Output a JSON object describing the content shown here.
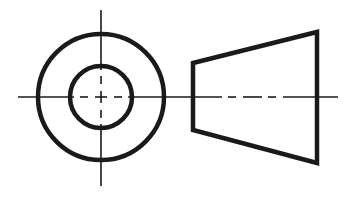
{
  "diagram": {
    "type": "orthographic-projection",
    "colors": {
      "line": "#1a1a1a",
      "background": "#ffffff"
    },
    "views": [
      {
        "name": "end-view",
        "shapes": [
          {
            "kind": "circle",
            "role": "outer-edge",
            "cx": 101,
            "cy": 97,
            "r": 63
          },
          {
            "kind": "circle",
            "role": "inner-hole",
            "cx": 101,
            "cy": 97,
            "r": 31
          },
          {
            "kind": "centerline",
            "orientation": "vertical",
            "x": 101,
            "y1": 10,
            "y2": 186
          },
          {
            "kind": "centerline",
            "orientation": "horizontal",
            "y": 97,
            "x1": 18,
            "x2": 180
          }
        ]
      },
      {
        "name": "side-view",
        "shapes": [
          {
            "kind": "trapezoid",
            "role": "frustum-profile",
            "points": [
              [
                193,
                63
              ],
              [
                317,
                32
              ],
              [
                317,
                163
              ],
              [
                193,
                130
              ]
            ]
          },
          {
            "kind": "centerline",
            "orientation": "horizontal",
            "y": 97,
            "x1": 180,
            "x2": 338,
            "dashed_segment": [
              220,
              300
            ]
          }
        ]
      }
    ]
  }
}
